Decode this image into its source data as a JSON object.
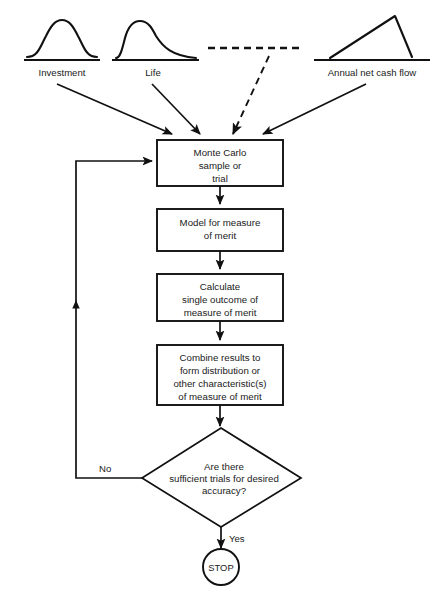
{
  "figure": {
    "background_color": "#ffffff",
    "line_color": "#111111"
  },
  "inputs": [
    {
      "id": "investment",
      "label": "Investment",
      "distribution_shape": "symmetric-bell",
      "connector": "solid-arrow"
    },
    {
      "id": "life",
      "label": "Life",
      "distribution_shape": "right-skewed",
      "connector": "solid-arrow"
    },
    {
      "id": "omitted",
      "label": "",
      "distribution_shape": "dashed-continuation",
      "connector": "dashed-arrow"
    },
    {
      "id": "annual-net-cash-flow",
      "label": "Annual net cash flow",
      "distribution_shape": "triangular",
      "connector": "solid-arrow"
    }
  ],
  "process_steps": [
    {
      "id": "monte-carlo-sample",
      "lines": [
        "Monte Carlo",
        "sample or",
        "trial"
      ]
    },
    {
      "id": "model-measure-of-merit",
      "lines": [
        "Model for measure",
        "of merit"
      ]
    },
    {
      "id": "calculate-single-outcome",
      "lines": [
        "Calculate",
        "single outcome of",
        "measure of merit"
      ]
    },
    {
      "id": "combine-results",
      "lines": [
        "Combine results to",
        "form distribution or",
        "other characteristic(s)",
        "of measure of  merit"
      ]
    }
  ],
  "decision": {
    "id": "sufficient-trials",
    "lines": [
      "Are there",
      "sufficient trials for desired",
      "accuracy?"
    ],
    "branch_no_label": "No",
    "branch_yes_label": "Yes"
  },
  "terminal": {
    "id": "stop",
    "label": "STOP"
  }
}
